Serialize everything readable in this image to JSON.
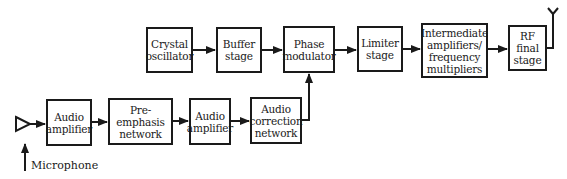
{
  "diagram": {
    "blocks": [
      {
        "id": "crystal",
        "label": "Crystal\noscillator"
      },
      {
        "id": "buffer",
        "label": "Buffer\nstage"
      },
      {
        "id": "phase",
        "label": "Phase\nmodulator"
      },
      {
        "id": "limiter",
        "label": "Limiter\nstage"
      },
      {
        "id": "intermediate",
        "label": "Intermediate\namplifiers/\nfrequency\nmultipliers"
      },
      {
        "id": "rf",
        "label": "RF\nfinal\nstage"
      },
      {
        "id": "audio_amp1",
        "label": "Audio\namplifier"
      },
      {
        "id": "preemphasis",
        "label": "Pre-emphasis\nnetwork"
      },
      {
        "id": "audio_amp2",
        "label": "Audio\namplifier"
      },
      {
        "id": "audio_correction",
        "label": "Audio\ncorrection\nnetwork"
      }
    ],
    "microphone_label": "Microphone",
    "connections": [
      [
        "microphone",
        "audio_amp1"
      ],
      [
        "audio_amp1",
        "preemphasis"
      ],
      [
        "preemphasis",
        "audio_amp2"
      ],
      [
        "audio_amp2",
        "audio_correction"
      ],
      [
        "audio_correction",
        "phase"
      ],
      [
        "crystal",
        "buffer"
      ],
      [
        "buffer",
        "phase"
      ],
      [
        "phase",
        "limiter"
      ],
      [
        "limiter",
        "intermediate"
      ],
      [
        "intermediate",
        "rf"
      ],
      [
        "rf",
        "antenna"
      ]
    ],
    "colors": {
      "line": "#1a1a1a",
      "background": "#ffffff"
    }
  }
}
